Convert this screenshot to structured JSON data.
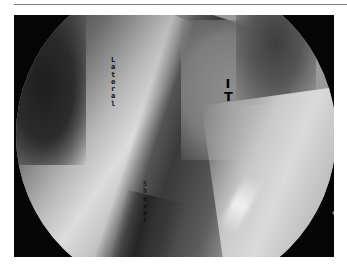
{
  "page": {
    "type": "arthroscopic-figure",
    "caption": ""
  },
  "figure": {
    "labels": {
      "lateral": "Lateral",
      "it": "IT",
      "shaver": "Shaver"
    },
    "colors": {
      "background_mask": "#050505",
      "bright_tissue": "#dcdcdc",
      "dark_tissue": "#3a3a3a",
      "label_text": "#0a0a0a",
      "page_rule": "#7a7a7a"
    }
  }
}
